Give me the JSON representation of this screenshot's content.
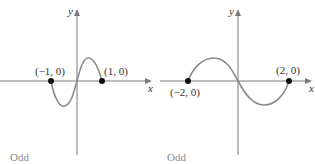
{
  "panels": [
    {
      "caption": "Odd",
      "x_axis_label": "x",
      "y_axis_label": "y",
      "points": [
        {
          "label": "(−1, 0)",
          "x": -1,
          "y": 0
        },
        {
          "label": "(1, 0)",
          "x": 1,
          "y": 0
        }
      ]
    },
    {
      "caption": "Odd",
      "x_axis_label": "x",
      "y_axis_label": "y",
      "points": [
        {
          "label": "(−2, 0)",
          "x": -2,
          "y": 0
        },
        {
          "label": "(2, 0)",
          "x": 2,
          "y": 0
        }
      ]
    }
  ],
  "colors": {
    "axis": "#7a7a7a",
    "curve": "#8a8a8a",
    "point": "#111111",
    "caption": "#8a8a8a"
  }
}
